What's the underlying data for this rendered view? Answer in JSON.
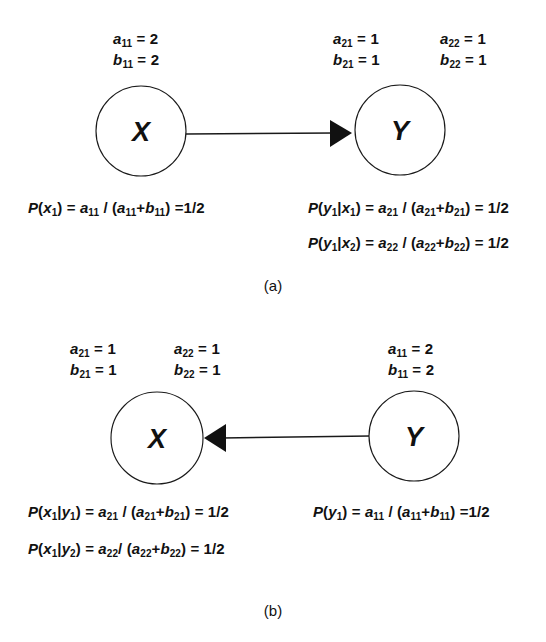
{
  "figure": {
    "background_color": "#ffffff",
    "ink_color": "#111111"
  },
  "panels": [
    {
      "id": "a",
      "caption": "(a)",
      "nodes": [
        {
          "id": "node-x-a",
          "label": "X"
        },
        {
          "id": "node-y-a",
          "label": "Y"
        }
      ],
      "edge": {
        "from": "X",
        "to": "Y",
        "direction": "right"
      },
      "param_blocks": [
        {
          "id": "params-x-a",
          "lines": [
            {
              "sym": "a",
              "sub": "11",
              "eq": "=",
              "val": "2"
            },
            {
              "sym": "b",
              "sub": "11",
              "eq": "=",
              "val": "2"
            }
          ]
        },
        {
          "id": "params-y-a-1",
          "lines": [
            {
              "sym": "a",
              "sub": "21",
              "eq": "=",
              "val": "1"
            },
            {
              "sym": "b",
              "sub": "21",
              "eq": "=",
              "val": "1"
            }
          ]
        },
        {
          "id": "params-y-a-2",
          "lines": [
            {
              "sym": "a",
              "sub": "22",
              "eq": "=",
              "val": "1"
            },
            {
              "sym": "b",
              "sub": "22",
              "eq": "=",
              "val": "1"
            }
          ]
        }
      ],
      "equations": [
        {
          "id": "eq-a-left-1",
          "text": "P(x1) = a11 / (a11+b11) =1/2"
        },
        {
          "id": "eq-a-right-1",
          "text": "P(y1|x1) = a21 / (a21+b21) = 1/2"
        },
        {
          "id": "eq-a-right-2",
          "text": "P(y1|x2) = a22 / (a22+b22) = 1/2"
        }
      ]
    },
    {
      "id": "b",
      "caption": "(b)",
      "nodes": [
        {
          "id": "node-x-b",
          "label": "X"
        },
        {
          "id": "node-y-b",
          "label": "Y"
        }
      ],
      "edge": {
        "from": "Y",
        "to": "X",
        "direction": "left"
      },
      "param_blocks": [
        {
          "id": "params-x-b-1",
          "lines": [
            {
              "sym": "a",
              "sub": "21",
              "eq": "=",
              "val": "1"
            },
            {
              "sym": "b",
              "sub": "21",
              "eq": "=",
              "val": "1"
            }
          ]
        },
        {
          "id": "params-x-b-2",
          "lines": [
            {
              "sym": "a",
              "sub": "22",
              "eq": "=",
              "val": "1"
            },
            {
              "sym": "b",
              "sub": "22",
              "eq": "=",
              "val": "1"
            }
          ]
        },
        {
          "id": "params-y-b",
          "lines": [
            {
              "sym": "a",
              "sub": "11",
              "eq": "=",
              "val": "2"
            },
            {
              "sym": "b",
              "sub": "11",
              "eq": "=",
              "val": "2"
            }
          ]
        }
      ],
      "equations": [
        {
          "id": "eq-b-left-1",
          "text": "P(x1|y1) = a21 / (a21+b21) = 1/2"
        },
        {
          "id": "eq-b-left-2",
          "text": "P(x1|y2) = a22/ (a22+b22) = 1/2"
        },
        {
          "id": "eq-b-right-1",
          "text": "P(y1) = a11 / (a11+b11) =1/2"
        }
      ]
    }
  ],
  "text": {
    "panel_a": {
      "params_x": {
        "a_sym": "a",
        "a_sub": "11",
        "a_val": "2",
        "b_sym": "b",
        "b_sub": "11",
        "b_val": "2"
      },
      "params_y1": {
        "a_sym": "a",
        "a_sub": "21",
        "a_val": "1",
        "b_sym": "b",
        "b_sub": "21",
        "b_val": "1"
      },
      "params_y2": {
        "a_sym": "a",
        "a_sub": "22",
        "a_val": "1",
        "b_sym": "b",
        "b_sub": "22",
        "b_val": "1"
      },
      "node_x": "X",
      "node_y": "Y",
      "caption": "(a)"
    },
    "panel_b": {
      "params_x1": {
        "a_sym": "a",
        "a_sub": "21",
        "a_val": "1",
        "b_sym": "b",
        "b_sub": "21",
        "b_val": "1"
      },
      "params_x2": {
        "a_sym": "a",
        "a_sub": "22",
        "a_val": "1",
        "b_sym": "b",
        "b_sub": "22",
        "b_val": "1"
      },
      "params_y": {
        "a_sym": "a",
        "a_sub": "11",
        "a_val": "2",
        "b_sym": "b",
        "b_sub": "11",
        "b_val": "2"
      },
      "node_x": "X",
      "node_y": "Y",
      "caption": "(b)"
    },
    "eq_tokens": {
      "P": "P",
      "open": "(",
      "close": ")",
      "bar": "|",
      "eq": "=",
      "slash": "/",
      "plus": "+",
      "half": "1/2",
      "x": "x",
      "y": "y",
      "a": "a",
      "b": "b",
      "one": "1",
      "two": "2",
      "sub11": "11",
      "sub21": "21",
      "sub22": "22"
    }
  }
}
